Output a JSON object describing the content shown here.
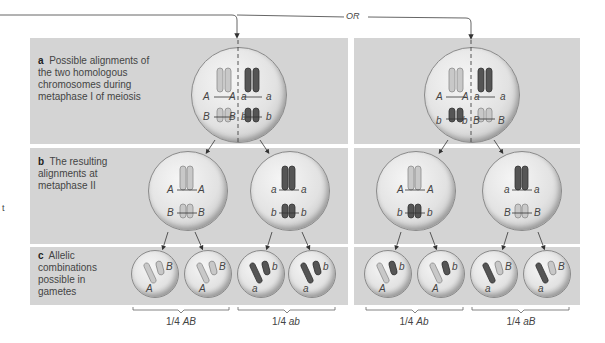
{
  "connector": {
    "or_label": "OR"
  },
  "rows": {
    "a": {
      "letter": "a",
      "text": "Possible alignments of the two homologous chromosomes during metaphase I of meiosis"
    },
    "b": {
      "letter": "b",
      "text": "The resulting alignments at metaphase II"
    },
    "c": {
      "letter": "c",
      "text": "Allelic combinations possible in gametes"
    }
  },
  "left_panel": {
    "metaphase1": {
      "alleles": [
        "A",
        "A",
        "a",
        "a",
        "B",
        "B",
        "b",
        "b"
      ]
    },
    "metaphase2": [
      {
        "alleles": [
          "A",
          "A",
          "B",
          "B"
        ]
      },
      {
        "alleles": [
          "a",
          "a",
          "b",
          "b"
        ]
      }
    ],
    "gametes": [
      {
        "alleles": [
          "A",
          "B"
        ]
      },
      {
        "alleles": [
          "A",
          "B"
        ]
      },
      {
        "alleles": [
          "a",
          "b"
        ]
      },
      {
        "alleles": [
          "a",
          "b"
        ]
      }
    ],
    "outcomes": [
      {
        "fraction": "1/4",
        "genotype": "AB"
      },
      {
        "fraction": "1/4",
        "genotype": "ab"
      }
    ]
  },
  "right_panel": {
    "metaphase1": {
      "alleles": [
        "A",
        "A",
        "a",
        "a",
        "b",
        "b",
        "B",
        "B"
      ]
    },
    "metaphase2": [
      {
        "alleles": [
          "A",
          "A",
          "b",
          "b"
        ]
      },
      {
        "alleles": [
          "a",
          "a",
          "B",
          "B"
        ]
      }
    ],
    "gametes": [
      {
        "alleles": [
          "A",
          "b"
        ]
      },
      {
        "alleles": [
          "A",
          "b"
        ]
      },
      {
        "alleles": [
          "a",
          "B"
        ]
      },
      {
        "alleles": [
          "a",
          "B"
        ]
      }
    ],
    "outcomes": [
      {
        "fraction": "1/4",
        "genotype": "Ab"
      },
      {
        "fraction": "1/4",
        "genotype": "aB"
      }
    ]
  },
  "edge_fragment": "t",
  "colors": {
    "band": "#d4d4d4",
    "light_chromosome": "#bdbdbd",
    "dark_chromosome": "#4a4a4a",
    "line": "#555555"
  }
}
